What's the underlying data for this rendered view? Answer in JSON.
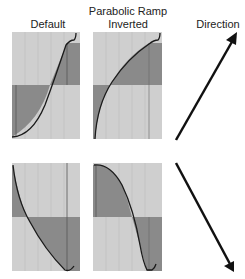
{
  "headers": {
    "default": "Default",
    "parabolic_line1": "Parabolic Ramp",
    "parabolic_line2": "Inverted",
    "direction": "Direction"
  },
  "colors": {
    "panel_light": "#cfcfcf",
    "panel_dark": "#8a8a8a",
    "curve": "#1a1a1a",
    "arrow": "#111111",
    "grid": "#bdbdbd"
  },
  "rows": [
    {
      "name": "increasing",
      "direction": "up-right"
    },
    {
      "name": "decreasing",
      "direction": "down-right"
    }
  ]
}
